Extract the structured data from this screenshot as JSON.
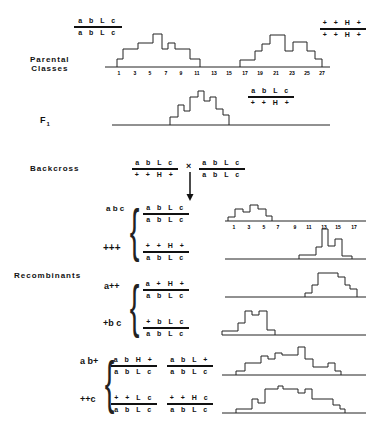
{
  "sections": {
    "parental": {
      "label_line1": "Parental",
      "label_line2": "Classes"
    },
    "f1": {
      "label": "F",
      "label_sub": "1"
    },
    "backcross": {
      "label": "Backcross",
      "cross_symbol": "×"
    },
    "recombinants": {
      "label": "Recombinants"
    }
  },
  "genotypes": {
    "parent_left": {
      "top": "a b L c",
      "bottom": "a b L c"
    },
    "parent_right": {
      "top": "+ + H +",
      "bottom": "+ + H +"
    },
    "f1": {
      "top": "a b L c",
      "bottom": "+ + H +"
    },
    "backcross_a": {
      "top": "a b L c",
      "bottom": "+ + H +"
    },
    "backcross_b": {
      "top": "a b L c",
      "bottom": "a b L c"
    },
    "abc": {
      "top": "a b L c",
      "bottom": "a b L c"
    },
    "ppp": {
      "top": "+ + H +",
      "bottom": "a b L c"
    },
    "app": {
      "top": "a + H +",
      "bottom": "a b L c"
    },
    "pbc": {
      "top": "+ b L c",
      "bottom": "a b L c"
    },
    "abp_1": {
      "top": "a b H +",
      "bottom": "a b L c"
    },
    "abp_2": {
      "top": "a b L +",
      "bottom": "a b L c"
    },
    "ppc_1": {
      "top": "+ + L c",
      "bottom": "a b L c"
    },
    "ppc_2": {
      "top": "+ + H c",
      "bottom": "a b L c"
    }
  },
  "classes": {
    "abc": "a b c",
    "ppp": "+++",
    "app": "a++",
    "pbc": "+b c",
    "abp": "a b+",
    "ppc": "++c"
  },
  "chart_data": [
    {
      "type": "bar",
      "title": "Parental Classes",
      "x_ticks": [
        "1",
        "3",
        "5",
        "7",
        "9",
        "11",
        "13",
        "15",
        "17",
        "19",
        "21",
        "23",
        "25",
        "27"
      ],
      "series": [
        {
          "name": "a b L c / a b L c",
          "x": [
            1,
            2,
            3,
            4,
            5,
            6,
            7,
            8,
            9,
            10,
            11
          ],
          "values": [
            1,
            2,
            2,
            3,
            3,
            4,
            2,
            3,
            2,
            2,
            1
          ]
        },
        {
          "name": "+ + H + / + + H +",
          "x": [
            17,
            18,
            19,
            20,
            21,
            22,
            23,
            24,
            25,
            26,
            27
          ],
          "values": [
            1,
            1,
            2,
            3,
            4,
            4,
            2,
            3,
            3,
            2,
            1
          ]
        }
      ]
    },
    {
      "type": "bar",
      "title": "F1",
      "series": [
        {
          "name": "a b L c / + + H +",
          "values": [
            1,
            2,
            1.5,
            3,
            3.5,
            2.5,
            2.5,
            1.5,
            1
          ]
        }
      ]
    },
    {
      "type": "bar",
      "title": "Backcross abc",
      "x_ticks": [
        "1",
        "3",
        "5",
        "7",
        "9",
        "11",
        "13",
        "15",
        "17"
      ],
      "series": [
        {
          "name": "abc",
          "x": [
            1,
            2,
            3,
            4,
            5,
            6
          ],
          "values": [
            1,
            2,
            1.6,
            2.4,
            2,
            1
          ]
        }
      ]
    },
    {
      "type": "bar",
      "title": "Backcross +++",
      "series": [
        {
          "name": "+++",
          "x": [
            10,
            11,
            12,
            13,
            14,
            15,
            16
          ],
          "values": [
            1,
            2,
            3,
            4,
            2,
            3,
            1
          ]
        }
      ]
    },
    {
      "type": "bar",
      "title": "Recombinants a++",
      "series": [
        {
          "name": "a++",
          "values": [
            1,
            2,
            3,
            4,
            4,
            3,
            2,
            1
          ]
        }
      ]
    },
    {
      "type": "bar",
      "title": "Recombinants +bc",
      "series": [
        {
          "name": "+bc",
          "values": [
            1,
            2,
            3,
            4,
            3.5,
            4,
            1
          ]
        }
      ]
    },
    {
      "type": "bar",
      "title": "Recombinants ab+",
      "series": [
        {
          "name": "ab+",
          "values": [
            1,
            3,
            3,
            4,
            3.5,
            4,
            4,
            3.5,
            5,
            3,
            2,
            2,
            2.5,
            1
          ]
        }
      ]
    },
    {
      "type": "bar",
      "title": "Recombinants ++c",
      "series": [
        {
          "name": "++c",
          "values": [
            1,
            1,
            3,
            2.5,
            4.5,
            5,
            4.5,
            4.5,
            4,
            4,
            3,
            2,
            1,
            1
          ]
        }
      ]
    }
  ],
  "histograms": [
    {
      "id": "parent_left",
      "base_y": 67,
      "steps": [
        [
          117,
          8
        ],
        [
          123,
          18
        ],
        [
          138,
          24
        ],
        [
          153,
          33
        ],
        [
          162,
          18
        ],
        [
          168,
          24
        ],
        [
          175,
          18
        ],
        [
          190,
          8
        ],
        [
          200,
          0
        ]
      ]
    },
    {
      "id": "parent_right",
      "base_y": 67,
      "steps": [
        [
          240,
          7
        ],
        [
          255,
          16
        ],
        [
          262,
          23
        ],
        [
          270,
          32
        ],
        [
          285,
          16
        ],
        [
          293,
          25
        ],
        [
          307,
          16
        ],
        [
          315,
          8
        ],
        [
          322,
          0
        ]
      ]
    },
    {
      "id": "f1",
      "base_y": 125,
      "steps": [
        [
          170,
          8
        ],
        [
          178,
          20
        ],
        [
          184,
          14
        ],
        [
          190,
          28
        ],
        [
          198,
          34
        ],
        [
          204,
          24
        ],
        [
          210,
          28
        ],
        [
          216,
          16
        ],
        [
          223,
          10
        ],
        [
          229,
          0
        ]
      ]
    },
    {
      "id": "abc",
      "base_y": 221,
      "steps": [
        [
          228,
          4
        ],
        [
          235,
          12
        ],
        [
          243,
          9
        ],
        [
          250,
          16
        ],
        [
          258,
          12
        ],
        [
          266,
          5
        ],
        [
          272,
          0
        ]
      ]
    },
    {
      "id": "ppp",
      "base_y": 259,
      "steps": [
        [
          299,
          4
        ],
        [
          316,
          12
        ],
        [
          322,
          30
        ],
        [
          328,
          13
        ],
        [
          335,
          20
        ],
        [
          342,
          3
        ],
        [
          352,
          0
        ]
      ]
    },
    {
      "id": "app",
      "base_y": 297,
      "steps": [
        [
          305,
          4
        ],
        [
          312,
          12
        ],
        [
          318,
          24
        ],
        [
          338,
          20
        ],
        [
          345,
          12
        ],
        [
          350,
          8
        ],
        [
          357,
          0
        ]
      ]
    },
    {
      "id": "pbc",
      "base_y": 335,
      "steps": [
        [
          222,
          4
        ],
        [
          238,
          12
        ],
        [
          245,
          24
        ],
        [
          252,
          20
        ],
        [
          259,
          24
        ],
        [
          267,
          5
        ],
        [
          275,
          0
        ]
      ]
    },
    {
      "id": "abp",
      "base_y": 375,
      "steps": [
        [
          236,
          4
        ],
        [
          245,
          12
        ],
        [
          261,
          19
        ],
        [
          268,
          16
        ],
        [
          275,
          22
        ],
        [
          282,
          20
        ],
        [
          298,
          28
        ],
        [
          305,
          16
        ],
        [
          313,
          8
        ],
        [
          328,
          12
        ],
        [
          335,
          4
        ],
        [
          341,
          0
        ]
      ]
    },
    {
      "id": "ppc",
      "base_y": 413,
      "steps": [
        [
          236,
          4
        ],
        [
          252,
          14
        ],
        [
          258,
          10
        ],
        [
          265,
          24
        ],
        [
          278,
          27
        ],
        [
          283,
          24
        ],
        [
          298,
          20
        ],
        [
          305,
          24
        ],
        [
          312,
          14
        ],
        [
          333,
          8
        ],
        [
          340,
          4
        ],
        [
          345,
          0
        ]
      ]
    }
  ],
  "axes": [
    {
      "id": "top",
      "x1": 105,
      "x2": 330,
      "y": 67,
      "ticks": [
        [
          "1",
          119
        ],
        [
          "3",
          135
        ],
        [
          "5",
          150
        ],
        [
          "7",
          166
        ],
        [
          "9",
          181
        ],
        [
          "11",
          197
        ],
        [
          "13",
          214
        ],
        [
          "15",
          229
        ],
        [
          "17",
          245
        ],
        [
          "19",
          260
        ],
        [
          "21",
          276
        ],
        [
          "23",
          292
        ],
        [
          "25",
          307
        ],
        [
          "27",
          322
        ]
      ]
    },
    {
      "id": "f1",
      "x1": 112,
      "x2": 330,
      "y": 125
    },
    {
      "id": "abc",
      "x1": 225,
      "x2": 366,
      "y": 221,
      "ticks": [
        [
          "1",
          234
        ],
        [
          "3",
          249
        ],
        [
          "5",
          264
        ],
        [
          "7",
          278
        ],
        [
          "9",
          295
        ],
        [
          "11",
          309
        ],
        [
          "13",
          324
        ],
        [
          "15",
          338
        ],
        [
          "17",
          354
        ]
      ]
    },
    {
      "id": "ppp",
      "x1": 225,
      "x2": 366,
      "y": 259
    },
    {
      "id": "app",
      "x1": 225,
      "x2": 366,
      "y": 297
    },
    {
      "id": "pbc",
      "x1": 222,
      "x2": 366,
      "y": 335
    },
    {
      "id": "abp",
      "x1": 222,
      "x2": 366,
      "y": 375
    },
    {
      "id": "ppc",
      "x1": 222,
      "x2": 366,
      "y": 413
    }
  ]
}
